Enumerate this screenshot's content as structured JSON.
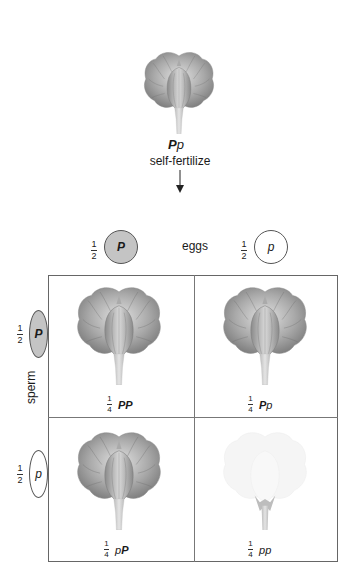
{
  "parent": {
    "genotype_dominant": "P",
    "genotype_recessive": "p",
    "process_label": "self-fertilize",
    "flower_color": "purple"
  },
  "eggs": {
    "label": "eggs",
    "gametes": [
      {
        "fraction_num": "1",
        "fraction_den": "2",
        "allele": "P",
        "type": "dominant"
      },
      {
        "fraction_num": "1",
        "fraction_den": "2",
        "allele": "p",
        "type": "recessive"
      }
    ]
  },
  "sperm": {
    "label": "sperm",
    "gametes": [
      {
        "fraction_num": "1",
        "fraction_den": "2",
        "allele": "P",
        "type": "dominant"
      },
      {
        "fraction_num": "1",
        "fraction_den": "2",
        "allele": "p",
        "type": "recessive"
      }
    ]
  },
  "punnett": {
    "cells": [
      {
        "row": 0,
        "col": 0,
        "num": "1",
        "den": "4",
        "a1": "P",
        "a2": "P",
        "phenotype": "purple"
      },
      {
        "row": 0,
        "col": 1,
        "num": "1",
        "den": "4",
        "a1": "P",
        "a2": "p",
        "phenotype": "purple"
      },
      {
        "row": 1,
        "col": 0,
        "num": "1",
        "den": "4",
        "a1": "p",
        "a2": "P",
        "phenotype": "purple"
      },
      {
        "row": 1,
        "col": 1,
        "num": "1",
        "den": "4",
        "a1": "p",
        "a2": "p",
        "phenotype": "white"
      }
    ]
  },
  "colors": {
    "dominant_gamete_fill": "#c4c4c4",
    "recessive_gamete_fill": "#ffffff",
    "purple_flower": "#8f8f8f",
    "white_flower": "#f2f2f2",
    "grid_line": "#777777"
  }
}
